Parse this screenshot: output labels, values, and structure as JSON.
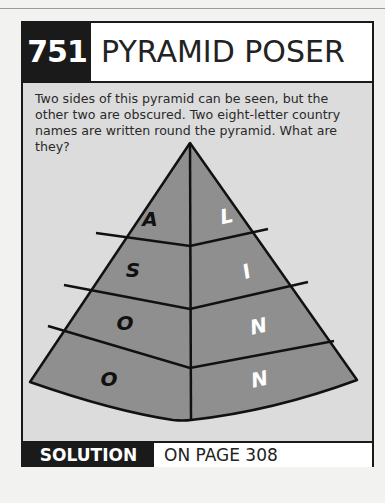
{
  "puzzle": {
    "number": "751",
    "title": "PYRAMID POSER",
    "description": "Two sides of this pyramid can be seen, but the other two are obscured. Two eight-letter country names are written round the pyramid. What are they?",
    "pyramid": {
      "left_face_letters": [
        "A",
        "S",
        "O",
        "O"
      ],
      "right_face_letters": [
        "L",
        "I",
        "N",
        "N"
      ],
      "face_color": "#8f8f8f",
      "left_letter_color": "#111111",
      "right_letter_color": "#ffffff"
    }
  },
  "footer": {
    "solution_label": "SOLUTION",
    "page_ref": "ON PAGE 308"
  }
}
